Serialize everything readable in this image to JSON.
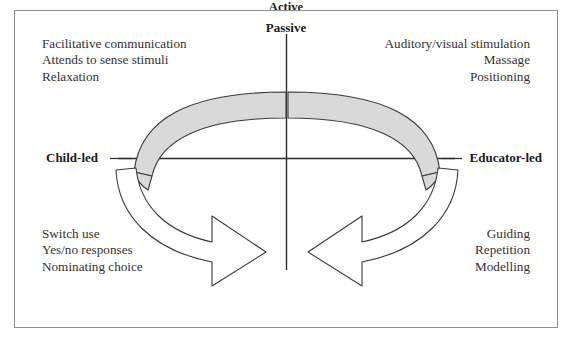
{
  "figure": {
    "type": "two-axis quadrant diagram",
    "frame_border_color": "#8f8f8f",
    "background_color": "#ffffff",
    "band_fill_color": "#d9d9d9",
    "band_stroke_color": "#3a3a3a",
    "arrow_fill_color": "#ffffff",
    "arrow_stroke_color": "#3a3a3a",
    "axis_color": "#2b2b2b"
  },
  "axes": {
    "vertical_top_label": "Passive",
    "horizontal_left_label": "Child-led",
    "horizontal_right_label": "Educator-led",
    "vertical_bottom_label": "Active\nInteractive\nPerson-object-event engagement"
  },
  "quadrants": {
    "top_left": {
      "name": "passive child-led",
      "lines": "Facilitative communication\nAttends to sense stimuli\nRelaxation"
    },
    "top_right": {
      "name": "passive educator-led",
      "lines": "Auditory/visual stimulation\nMassage\nPositioning"
    },
    "bottom_left": {
      "name": "active child-led",
      "lines": "Switch use\nYes/no responses\nNominating choice"
    },
    "bottom_right": {
      "name": "active educator-led",
      "lines": "Guiding\nRepetition\nModelling"
    }
  },
  "flow": {
    "top_left_band": "shaded arc band sweeping from Child-led axis up to centre",
    "top_right_band": "shaded arc band sweeping from centre down to Educator-led axis",
    "bottom_left_arrow": "curved arrow from Child-led axis pointing in toward Active centre",
    "bottom_right_arrow": "curved arrow from Educator-led axis pointing in toward Active centre"
  },
  "caption": {
    "fragment": ""
  }
}
